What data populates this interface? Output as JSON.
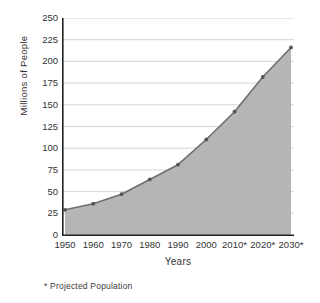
{
  "chart_data": {
    "type": "area",
    "title": "",
    "xlabel": "Years",
    "ylabel": "Millions of People",
    "categories": [
      "1950",
      "1960",
      "1970",
      "1980",
      "1990",
      "2000",
      "2010*",
      "2020*",
      "2030*"
    ],
    "values": [
      29,
      36,
      47,
      64,
      81,
      110,
      142,
      182,
      216
    ],
    "xticklabels": [
      "1950",
      "1960",
      "1970",
      "1980",
      "1990",
      "2000",
      "2010*",
      "2020*",
      "2030*"
    ],
    "yticklabels": [
      "0",
      "25",
      "50",
      "75",
      "100",
      "125",
      "150",
      "175",
      "200",
      "225",
      "250"
    ],
    "yticks": [
      0,
      25,
      50,
      75,
      100,
      125,
      150,
      175,
      200,
      225,
      250
    ],
    "ylim": [
      0,
      250
    ],
    "xlim": [
      1950,
      2030
    ],
    "grid": "horizontal",
    "legend": "none",
    "annotation": "* Projected Population",
    "series": [
      {
        "name": "Population",
        "values": [
          29,
          36,
          47,
          64,
          81,
          110,
          142,
          182,
          216
        ]
      }
    ],
    "colors": {
      "area_fill": "#b5b5b5",
      "line": "#6e6e6e",
      "marker": "#555555",
      "gridline": "#c9c9c9",
      "axis": "#222222",
      "text": "#333333",
      "background": "#ffffff"
    }
  },
  "footnote": {
    "text": "* Projected Population"
  },
  "axis_titles": {
    "x": "Years",
    "y": "Millions of People"
  }
}
